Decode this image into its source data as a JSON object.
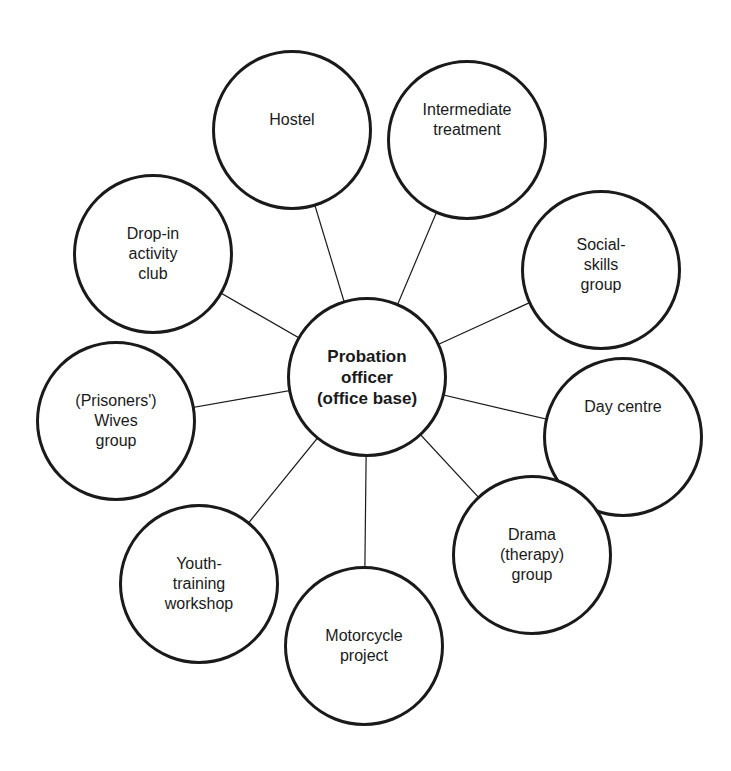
{
  "diagram": {
    "center": {
      "label": "Probation\nofficer\n(office base)",
      "x": 367,
      "y": 377,
      "r": 80
    },
    "nodes": [
      {
        "id": "hostel",
        "label": "Hostel",
        "x": 292,
        "y": 130,
        "r": 80,
        "label_dy": -10
      },
      {
        "id": "intermediate-treatment",
        "label": "Intermediate\ntreatment",
        "x": 467,
        "y": 140,
        "r": 80,
        "label_dy": -20
      },
      {
        "id": "social-skills-group",
        "label": "Social-\nskills\ngroup",
        "x": 601,
        "y": 270,
        "r": 80,
        "label_dy": -5
      },
      {
        "id": "day-centre",
        "label": "Day centre",
        "x": 623,
        "y": 437,
        "r": 80,
        "label_dy": -30
      },
      {
        "id": "drama-therapy-group",
        "label": "Drama\n(therapy)\ngroup",
        "x": 532,
        "y": 555,
        "r": 80,
        "label_dy": 0
      },
      {
        "id": "motorcycle-project",
        "label": "Motorcycle\nproject",
        "x": 364,
        "y": 646,
        "r": 80,
        "label_dy": 0
      },
      {
        "id": "youth-training-workshop",
        "label": "Youth-\ntraining\nworkshop",
        "x": 199,
        "y": 584,
        "r": 80,
        "label_dy": 0
      },
      {
        "id": "prisoners-wives-group",
        "label": "(Prisoners')\nWives\ngroup",
        "x": 116,
        "y": 421,
        "r": 80,
        "label_dy": 0
      },
      {
        "id": "drop-in-activity-club",
        "label": "Drop-in\nactivity\nclub",
        "x": 153,
        "y": 254,
        "r": 80,
        "label_dy": 0
      }
    ],
    "colors": {
      "stroke": "#1a1a1a",
      "background": "#ffffff"
    }
  }
}
